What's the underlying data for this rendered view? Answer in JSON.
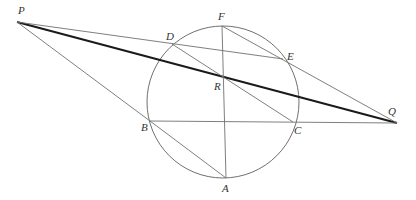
{
  "diagram": {
    "type": "geometry",
    "colors": {
      "line": "#707070",
      "thick_line": "#1a1a1a",
      "circle": "#707070",
      "label": "#333333"
    },
    "circle": {
      "cx": 223,
      "cy": 102,
      "r": 76
    },
    "points": {
      "P": {
        "x": 17,
        "y": 22,
        "label": "P",
        "lx": 18,
        "ly": 14
      },
      "Q": {
        "x": 397,
        "y": 123,
        "label": "Q",
        "lx": 388,
        "ly": 115
      },
      "F": {
        "x": 222,
        "y": 26,
        "label": "F",
        "lx": 218,
        "ly": 20
      },
      "D": {
        "x": 172,
        "y": 44,
        "label": "D",
        "lx": 166,
        "ly": 40
      },
      "E": {
        "x": 283,
        "y": 59,
        "label": "E",
        "lx": 287,
        "ly": 60
      },
      "R": {
        "x": 224,
        "y": 77,
        "label": "R",
        "lx": 214,
        "ly": 90
      },
      "B": {
        "x": 150,
        "y": 121,
        "label": "B",
        "lx": 141,
        "ly": 131
      },
      "C": {
        "x": 293,
        "y": 122,
        "label": "C",
        "lx": 294,
        "ly": 134
      },
      "A": {
        "x": 226,
        "y": 178,
        "label": "A",
        "lx": 222,
        "ly": 192
      }
    },
    "segments": [
      {
        "from": "P",
        "to": "Q",
        "weight": "thick"
      },
      {
        "from": "P",
        "to": "E",
        "weight": "thin"
      },
      {
        "from": "P",
        "to": "B",
        "weight": "thin"
      },
      {
        "from": "B",
        "to": "Q",
        "weight": "thin"
      },
      {
        "from": "F",
        "to": "Q",
        "weight": "thin"
      },
      {
        "from": "F",
        "to": "A",
        "weight": "thin"
      },
      {
        "from": "D",
        "to": "C",
        "weight": "thin"
      },
      {
        "from": "B",
        "to": "A",
        "weight": "thin"
      }
    ],
    "labels": [
      "P",
      "Q",
      "F",
      "D",
      "E",
      "R",
      "B",
      "C",
      "A"
    ]
  }
}
